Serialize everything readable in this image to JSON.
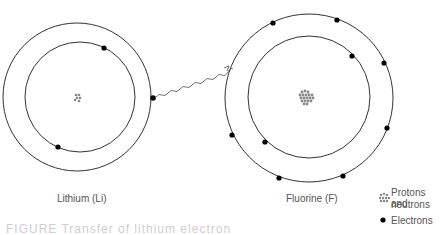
{
  "atoms": [
    {
      "name": "Lithium",
      "symbol": "Li",
      "label": "Lithium (Li)",
      "shells": 2,
      "inner_electrons": 2,
      "outer_electrons": 1
    },
    {
      "name": "Fluorine",
      "symbol": "F",
      "label": "Fluorine (F)",
      "shells": 2,
      "inner_electrons": 2,
      "outer_electrons": 7
    }
  ],
  "transfer": {
    "description": "Electron transferred from lithium outer shell to fluorine outer shell",
    "arrow_style": "wavy"
  },
  "legend": {
    "nucleus_label_line1": "Protons and",
    "nucleus_label_line2": "neutrons",
    "electron_label": "Electrons"
  },
  "caption": {
    "text": "FIGURE  Transfer of lithium electron"
  },
  "colors": {
    "orbit": "#333333",
    "electron": "#000000",
    "nucleus": "#888888",
    "text": "#555555"
  }
}
